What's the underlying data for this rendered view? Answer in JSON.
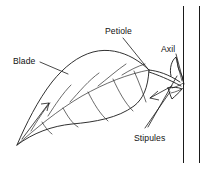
{
  "figure": {
    "kind": "botanical-line-diagram",
    "background_color": "#ffffff",
    "line_color": "#1a1a1a"
  },
  "labels": {
    "blade": "Blade",
    "petiole": "Petiole",
    "axil": "Axil",
    "stipules": "Stipules"
  },
  "parts": [
    {
      "name": "blade",
      "label": "Blade",
      "description": "Broad flat leaf lamina with pinnate venation"
    },
    {
      "name": "petiole",
      "label": "Petiole",
      "description": "Leaf stalk joining blade to stem"
    },
    {
      "name": "axil",
      "label": "Axil",
      "description": "Angle between petiole and stem"
    },
    {
      "name": "stipules",
      "label": "Stipules",
      "description": "Paired appendages at petiole base"
    },
    {
      "name": "stem",
      "label": "Stem",
      "description": "Vertical stem drawn as two parallel lines"
    }
  ]
}
